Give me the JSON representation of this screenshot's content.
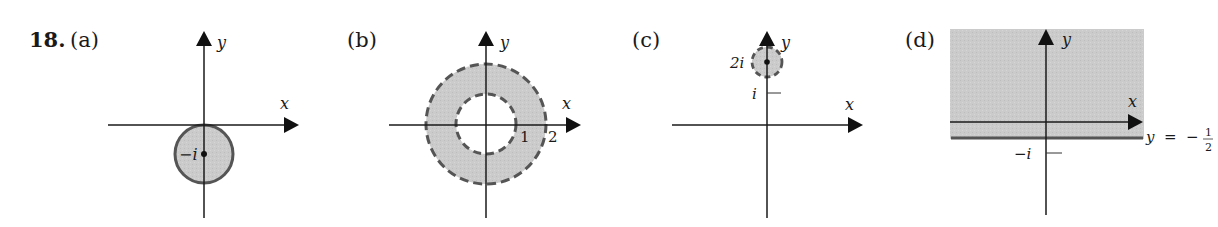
{
  "problem": {
    "number": "18.",
    "parts": [
      {
        "label": "(a)",
        "axes": {
          "x": "x",
          "y": "y"
        },
        "region": "closed disk",
        "center_label": "−i",
        "boundary": "solid"
      },
      {
        "label": "(b)",
        "axes": {
          "x": "x",
          "y": "y"
        },
        "region": "open annulus",
        "tick_labels": [
          "1",
          "2"
        ],
        "boundary": "dashed"
      },
      {
        "label": "(c)",
        "axes": {
          "x": "x",
          "y": "y"
        },
        "region": "open disk",
        "center_label": "2i",
        "tick_label": "i",
        "boundary": "dashed"
      },
      {
        "label": "(d)",
        "axes": {
          "x": "x",
          "y": "y"
        },
        "region": "half-plane",
        "tick_label": "−i",
        "line_label": "y  =  −",
        "fraction": {
          "num": "1",
          "den": "2"
        },
        "boundary": "solid"
      }
    ]
  },
  "colors": {
    "fill": "#c8c8c8",
    "stroke": "#555555",
    "axis": "#1a1a1a"
  }
}
